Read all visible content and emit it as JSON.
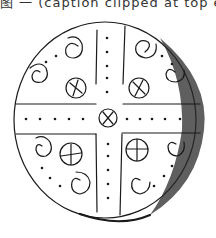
{
  "caption": {
    "text": "图 一  (caption clipped at top edge)",
    "visible": "partial"
  },
  "figure": {
    "motifs": [
      "central-cross",
      "center-circle-with-x",
      "spirals",
      "circles-with-cross",
      "dot-rows",
      "shaded-edge"
    ],
    "ink_color": "#1a1a1a",
    "background": "#ffffff"
  }
}
